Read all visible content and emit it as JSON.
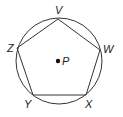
{
  "diagram": {
    "circle": {
      "center": "P",
      "cx": 59,
      "cy": 61,
      "r": 43
    },
    "vertices": [
      {
        "label": "V",
        "x": 58,
        "y": 19,
        "lx": 55,
        "ly": 14
      },
      {
        "label": "W",
        "x": 100,
        "y": 50,
        "lx": 103,
        "ly": 53
      },
      {
        "label": "X",
        "x": 86,
        "y": 95,
        "lx": 85,
        "ly": 108
      },
      {
        "label": "Y",
        "x": 33,
        "y": 95,
        "lx": 24,
        "ly": 108
      },
      {
        "label": "Z",
        "x": 17,
        "y": 48,
        "lx": 7,
        "ly": 52
      }
    ],
    "center_point": {
      "label": "P",
      "x": 58,
      "y": 61,
      "lx": 62,
      "ly": 65
    },
    "colors": {
      "stroke": "#333333",
      "text": "#222222"
    }
  }
}
